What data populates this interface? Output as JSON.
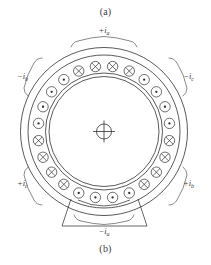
{
  "figure": {
    "caption_top": "(a)",
    "caption_bottom": "(b)",
    "title_hidden": "",
    "center_symbol_name": "shaft-center-crosshair"
  },
  "phase_labels": [
    {
      "id": "top",
      "text": "+i",
      "sub": "a",
      "angle_deg": -90,
      "position": "top"
    },
    {
      "id": "upper-left",
      "text": "−i",
      "sub": "b",
      "angle_deg": -150,
      "position": "upper-left"
    },
    {
      "id": "upper-right",
      "text": "−i",
      "sub": "c",
      "angle_deg": -30,
      "position": "upper-right"
    },
    {
      "id": "lower-left",
      "text": "+i",
      "sub": "c",
      "angle_deg": 150,
      "position": "lower-left"
    },
    {
      "id": "lower-right",
      "text": "+i",
      "sub": "b",
      "angle_deg": 30,
      "position": "lower-right"
    },
    {
      "id": "bottom",
      "text": "−i",
      "sub": "a",
      "angle_deg": 90,
      "position": "bottom"
    }
  ],
  "slots": {
    "count": 24,
    "groups": [
      {
        "phase": "+i_a",
        "symbol": "cross",
        "start_index": 0,
        "length": 4
      },
      {
        "phase": "−i_c",
        "symbol": "dot",
        "start_index": 4,
        "length": 4
      },
      {
        "phase": "+i_b",
        "symbol": "cross",
        "start_index": 8,
        "length": 4
      },
      {
        "phase": "−i_a",
        "symbol": "dot",
        "start_index": 12,
        "length": 4
      },
      {
        "phase": "+i_c",
        "symbol": "cross",
        "start_index": 16,
        "length": 4
      },
      {
        "phase": "−i_b",
        "symbol": "dot",
        "start_index": 20,
        "length": 4
      }
    ],
    "symbol_meanings": {
      "cross": "current into page",
      "dot": "current out of page"
    }
  },
  "geometry": {
    "center_x": 104,
    "center_y": 132,
    "stator_outer_radius": 84,
    "stator_mid_radius": 76,
    "slot_ring_radius": 66,
    "bore_outer_radius": 58,
    "bore_inner_radius": 55,
    "slot_circle_radius": 5.2,
    "hub_radius": 8
  },
  "colors": {
    "line": "#303030",
    "bracket": "#555555",
    "label": "#3d3d3d",
    "background": "#ffffff"
  }
}
